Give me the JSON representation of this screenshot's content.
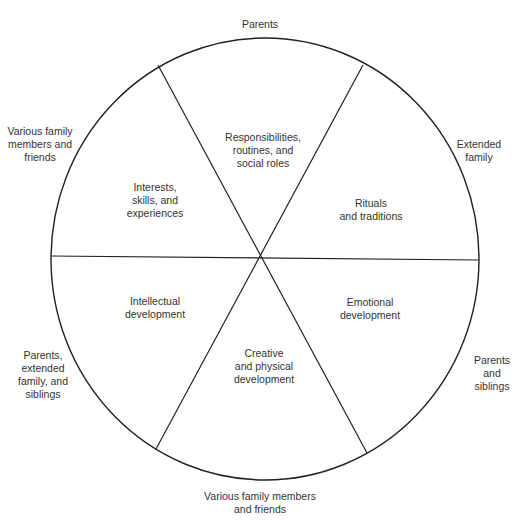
{
  "diagram": {
    "type": "segmented-circle",
    "segments_count": 6,
    "colors": {
      "line": "#222222",
      "text": "#333333",
      "background": "#ffffff"
    },
    "segments": [
      {
        "position": "top",
        "inner_label": "Responsibilities,\nroutines, and\nsocial roles",
        "outer_label": "Parents"
      },
      {
        "position": "upper-right",
        "inner_label": "Rituals\nand traditions",
        "outer_label": "Extended\nfamily"
      },
      {
        "position": "lower-right",
        "inner_label": "Emotional\ndevelopment",
        "outer_label": "Parents and\nsiblings"
      },
      {
        "position": "bottom",
        "inner_label": "Creative\nand physical\ndevelopment",
        "outer_label": "Various family members\nand friends"
      },
      {
        "position": "lower-left",
        "inner_label": "Intellectual\ndevelopment",
        "outer_label": "Parents,\nextended\nfamily, and\nsiblings"
      },
      {
        "position": "upper-left",
        "inner_label": "Interests,\nskills, and\nexperiences",
        "outer_label": "Various family\nmembers and\nfriends"
      }
    ]
  }
}
